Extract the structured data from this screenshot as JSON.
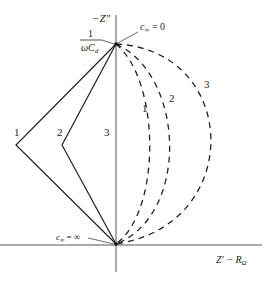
{
  "diagram": {
    "axes": {
      "y_label": "−Z″",
      "x_label_main": "Z′ − R",
      "x_label_sub": "Ω"
    },
    "top_marker": {
      "fraction_num": "1",
      "fraction_den_omega": "ωC",
      "fraction_den_sub": "d",
      "annotation": "c∞ = 0",
      "annotation_c": "c",
      "annotation_sub": "∞",
      "annotation_rest": " = 0"
    },
    "bottom_marker": {
      "annotation_c": "c",
      "annotation_sub": "∞",
      "annotation_rest": " = ∞"
    },
    "solid_curve_labels": [
      "1",
      "2",
      "3"
    ],
    "dashed_curve_labels": [
      "1",
      "2",
      "3"
    ],
    "colors": {
      "line": "#222222",
      "axis": "#555555"
    }
  }
}
